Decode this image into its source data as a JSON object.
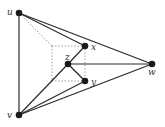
{
  "diagram": {
    "type": "graph-drawing",
    "colors": {
      "edge": "#2a2a2a",
      "dotted": "#7a7a7a",
      "node": "#1a1a1a",
      "background": "#ffffff"
    },
    "nodes": [
      {
        "id": "u",
        "label": "u"
      },
      {
        "id": "v",
        "label": "v"
      },
      {
        "id": "w",
        "label": "w"
      },
      {
        "id": "x",
        "label": "x"
      },
      {
        "id": "z",
        "label": "z"
      },
      {
        "id": "y",
        "label": "y"
      }
    ],
    "edges": [
      {
        "from": "u",
        "to": "v",
        "style": "solid"
      },
      {
        "from": "u",
        "to": "x",
        "style": "solid"
      },
      {
        "from": "u",
        "to": "w",
        "style": "solid"
      },
      {
        "from": "v",
        "to": "w",
        "style": "solid"
      },
      {
        "from": "v",
        "to": "z",
        "style": "solid"
      },
      {
        "from": "v",
        "to": "y",
        "style": "solid"
      },
      {
        "from": "z",
        "to": "x",
        "style": "solid"
      },
      {
        "from": "z",
        "to": "y",
        "style": "solid"
      },
      {
        "from": "z",
        "to": "w",
        "style": "solid"
      }
    ],
    "guides": [
      {
        "name": "u-to-box-corner",
        "style": "dotted"
      },
      {
        "name": "box-top",
        "style": "dotted"
      },
      {
        "name": "box-left",
        "style": "dotted"
      },
      {
        "name": "box-bottom",
        "style": "dotted"
      },
      {
        "name": "box-right",
        "style": "dotted"
      }
    ]
  }
}
